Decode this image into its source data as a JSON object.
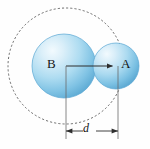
{
  "figure": {
    "background_color": "#fefefe",
    "width": 150,
    "height": 149,
    "labels": {
      "sphere_b_label": "B",
      "sphere_a_label": "A",
      "distance_label": "d"
    },
    "colors": {
      "sphere_fill_light": "#dff0fa",
      "sphere_fill_mid": "#9fd2ec",
      "sphere_fill_dark": "#5aa8d6",
      "sphere_edge": "#4f9cc9",
      "line_color": "#3a3a3a",
      "dashed_circle_color": "#555555",
      "text_color": "#151515"
    },
    "elements": {
      "sphere_b": {
        "name": "B",
        "cx": 64,
        "cy": 66,
        "r": 32
      },
      "sphere_a": {
        "name": "A",
        "cx": 116,
        "cy": 66,
        "r": 23
      },
      "dashed_circle": {
        "cx": 66,
        "cy": 66,
        "r": 58,
        "style": "dashed"
      },
      "center_arrow": {
        "from_x": 66,
        "from_y": 66,
        "to_x": 118,
        "to_y": 66
      },
      "dimension": {
        "left_x": 66,
        "right_x": 118,
        "y": 131,
        "extension_top_y": 66,
        "extension_bottom_y": 139
      }
    }
  }
}
